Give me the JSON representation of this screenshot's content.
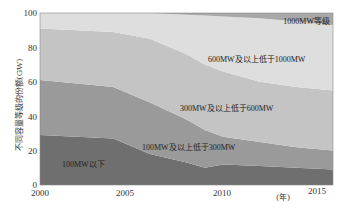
{
  "chart_data": {
    "type": "area",
    "stacked": true,
    "title": "",
    "xlabel": "(年)",
    "ylabel": "不同容量等级的份额(GW)",
    "xlim": [
      2000,
      2016
    ],
    "ylim": [
      0,
      100
    ],
    "x_ticks": [
      2000,
      2005,
      2010,
      2015
    ],
    "y_ticks": [
      0,
      20,
      40,
      60,
      80,
      100
    ],
    "grid": false,
    "legend_position": "inline labels",
    "x": [
      2000,
      2004,
      2006,
      2008,
      2009,
      2010,
      2012,
      2014,
      2016
    ],
    "cumulative_tops": [
      {
        "name": "100MW以下",
        "values": [
          29,
          27,
          18,
          13,
          10,
          12,
          11,
          10,
          9
        ]
      },
      {
        "name": "100MW及以上低于300MW",
        "values": [
          61,
          57,
          48,
          38,
          32,
          28,
          25,
          22,
          20
        ]
      },
      {
        "name": "300MW及以上低于600MW",
        "values": [
          91,
          89,
          85,
          76,
          70,
          66,
          60,
          57,
          55
        ]
      },
      {
        "name": "600MW及以上低于1000MW",
        "values": [
          100,
          100,
          100,
          99,
          98.5,
          98,
          97,
          95,
          93
        ]
      },
      {
        "name": "1000MW等级",
        "values": [
          100,
          100,
          100,
          100,
          100,
          100,
          100,
          100,
          100
        ]
      }
    ],
    "series": [
      {
        "name": "100MW以下",
        "color": "#6f6f6f",
        "values": [
          29,
          27,
          18,
          13,
          10,
          12,
          11,
          10,
          9
        ]
      },
      {
        "name": "100MW及以上低于300MW",
        "color": "#9a9a9a",
        "values": [
          32,
          30,
          30,
          25,
          22,
          16,
          14,
          12,
          11
        ]
      },
      {
        "name": "300MW及以上低于600MW",
        "color": "#c4c4c4",
        "values": [
          30,
          32,
          37,
          38,
          38,
          38,
          35,
          35,
          35
        ]
      },
      {
        "name": "600MW及以上低于1000MW",
        "color": "#dedede",
        "values": [
          9,
          11,
          15,
          23,
          28.5,
          32,
          37,
          38,
          38
        ]
      },
      {
        "name": "1000MW等级",
        "color": "#a8a8a8",
        "values": [
          0,
          0,
          0,
          1,
          1.5,
          2,
          3,
          5,
          7
        ]
      }
    ]
  },
  "labels": {
    "ylabel": "不同容量等级的份额(GW)",
    "xlabel": "(年)",
    "s0": "100MW以下",
    "s1": "100MW及以上低于300MW",
    "s2": "300MW及以上低于600MW",
    "s3": "600MW及以上低于1000MW",
    "s4": "1000MW等级",
    "x0": "2000",
    "x1": "2005",
    "x2": "2010",
    "x3": "2015",
    "y0": "0",
    "y1": "20",
    "y2": "40",
    "y3": "60",
    "y4": "80",
    "y5": "100"
  }
}
